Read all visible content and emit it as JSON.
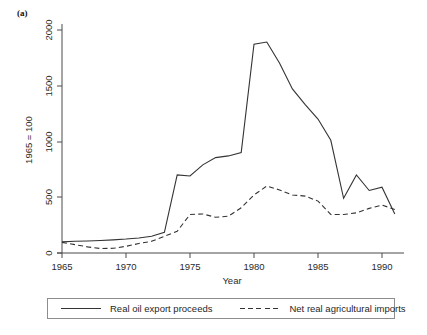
{
  "panel": {
    "label": "(a)"
  },
  "legend": {
    "items": [
      {
        "label": "Real oil export proceeds",
        "style": "solid",
        "icon": "solid-line-icon"
      },
      {
        "label": "Net real agricultural imports",
        "style": "dashed",
        "icon": "dashed-line-icon"
      }
    ]
  },
  "chart_data": {
    "type": "line",
    "title": "",
    "subtitle": "",
    "xlabel": "Year",
    "ylabel": "1965 = 100",
    "xlim": [
      1965,
      1991
    ],
    "ylim": [
      0,
      2100
    ],
    "grid": false,
    "legend_position": "bottom",
    "xticks": [
      1965,
      1970,
      1975,
      1980,
      1985,
      1990
    ],
    "xtick_labels": [
      "1965",
      "1970",
      "1975",
      "1980",
      "1985",
      "1990"
    ],
    "yticks": [
      0,
      500,
      1000,
      1500,
      2000
    ],
    "ytick_labels": [
      "0",
      "500",
      "1000",
      "1500",
      "2000"
    ],
    "x": [
      1965,
      1966,
      1967,
      1968,
      1969,
      1970,
      1971,
      1972,
      1973,
      1974,
      1975,
      1976,
      1977,
      1978,
      1979,
      1980,
      1981,
      1982,
      1983,
      1984,
      1985,
      1986,
      1987,
      1988,
      1989,
      1990,
      1991
    ],
    "series": [
      {
        "name": "Real oil export proceeds",
        "style": "solid",
        "values": [
          100,
          105,
          108,
          112,
          118,
          125,
          135,
          150,
          185,
          700,
          690,
          790,
          855,
          870,
          900,
          1870,
          1890,
          1700,
          1470,
          1330,
          1200,
          1010,
          490,
          700,
          560,
          590,
          350
        ]
      },
      {
        "name": "Net real agricultural imports",
        "style": "dashed",
        "values": [
          95,
          75,
          55,
          40,
          42,
          60,
          85,
          105,
          150,
          195,
          345,
          350,
          320,
          330,
          405,
          520,
          600,
          565,
          520,
          510,
          465,
          345,
          345,
          360,
          400,
          430,
          390
        ]
      }
    ]
  }
}
